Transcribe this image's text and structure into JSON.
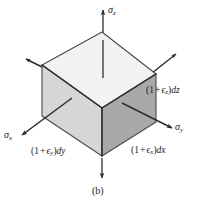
{
  "figure": {
    "caption": "(b)",
    "background_color": "#ffffff",
    "line_color": "#1a1a1a"
  },
  "cube": {
    "top_face_color": "#f2f2f2",
    "left_face_color": "#d6d6d6",
    "right_face_color": "#a9a9a9",
    "edge_color": "#3a3a3a"
  },
  "stress_labels": {
    "sigma_z": {
      "symbol": "σ",
      "subscript": "z"
    },
    "sigma_x": {
      "symbol": "σ",
      "subscript": "x"
    },
    "sigma_y": {
      "symbol": "σ",
      "subscript": "y"
    }
  },
  "dimension_labels": {
    "dz": {
      "open": "(1",
      "op": "+",
      "eps": "ϵ",
      "sub": "z",
      "close": ")",
      "diff": "dz"
    },
    "dx": {
      "open": "(1",
      "op": "+",
      "eps": "ϵ",
      "sub": "x",
      "close": ")",
      "diff": "dx"
    },
    "dy": {
      "open": "(1",
      "op": "+",
      "eps": "ϵ",
      "sub": "y",
      "close": ")",
      "diff": "dy"
    }
  },
  "arrows": {
    "sigma_z_up": "vertical arrow pointing up from top face",
    "sigma_z_down": "vertical arrow pointing down from bottom vertex",
    "sigma_y_right": "arrow pointing down-right from right face",
    "sigma_y_upright": "arrow pointing up-right from top-right vertex",
    "sigma_x_left": "arrow pointing down-left from left face",
    "sigma_x_upleft": "arrow pointing up-left from top-left vertex"
  }
}
